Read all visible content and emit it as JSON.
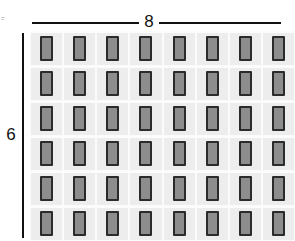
{
  "diagram": {
    "type": "module-array-layout",
    "dimensions": {
      "width_label": "8",
      "height_label": "6",
      "width_units": "",
      "height_units": ""
    },
    "array": {
      "columns": 8,
      "rows": 6,
      "total_modules": 48,
      "module_orientation": "portrait"
    },
    "colors": {
      "module_fill": "#8d8d8d",
      "module_border": "#2b2b2b",
      "cell_background": "#ededed",
      "panel_background": "#f0f0f0",
      "dimension_line": "#111111",
      "page_background": "#ffffff"
    },
    "row_labels": [
      "1",
      "2",
      "3",
      "4",
      "5",
      "6"
    ],
    "column_labels": [
      "1",
      "2",
      "3",
      "4",
      "5",
      "6",
      "7",
      "8"
    ]
  }
}
